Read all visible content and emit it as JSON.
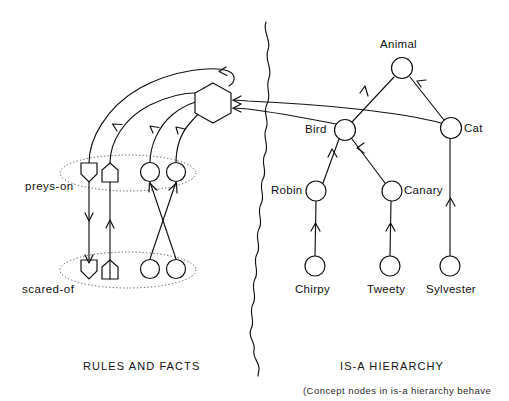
{
  "figure": {
    "background_color": "#ffffff",
    "ink_color": "#111111",
    "group_outline_color": "#4a4a4a"
  },
  "sections": {
    "left": {
      "label": "RULES AND FACTS"
    },
    "right": {
      "label": "IS-A HIERARCHY"
    }
  },
  "caption": {
    "text": "(Concept nodes in is-a hierarchy behave"
  },
  "relations": {
    "preys_on": {
      "label": "preys-on"
    },
    "scared_of": {
      "label": "scared-of"
    }
  },
  "hierarchy": {
    "nodes": [
      {
        "id": "animal",
        "label": "Animal",
        "x": 402,
        "y": 68,
        "r": 10.5,
        "label_pos": "above"
      },
      {
        "id": "bird",
        "label": "Bird",
        "x": 345,
        "y": 130,
        "r": 10.5,
        "label_pos": "left"
      },
      {
        "id": "cat",
        "label": "Cat",
        "x": 451,
        "y": 128,
        "r": 10.5,
        "label_pos": "right"
      },
      {
        "id": "robin",
        "label": "Robin",
        "x": 316,
        "y": 191,
        "r": 10.0,
        "label_pos": "left"
      },
      {
        "id": "canary",
        "label": "Canary",
        "x": 392,
        "y": 191,
        "r": 10.0,
        "label_pos": "right"
      },
      {
        "id": "chirpy",
        "label": "Chirpy",
        "x": 315,
        "y": 266,
        "r": 10.0,
        "label_pos": "below"
      },
      {
        "id": "tweety",
        "label": "Tweety",
        "x": 390,
        "y": 266,
        "r": 10.0,
        "label_pos": "below"
      },
      {
        "id": "sylvester",
        "label": "Sylvester",
        "x": 450,
        "y": 266,
        "r": 10.0,
        "label_pos": "below"
      }
    ],
    "isa_links": [
      {
        "from": "bird",
        "to": "animal"
      },
      {
        "from": "cat",
        "to": "animal"
      },
      {
        "from": "robin",
        "to": "bird"
      },
      {
        "from": "canary",
        "to": "bird"
      },
      {
        "from": "chirpy",
        "to": "robin"
      },
      {
        "from": "tweety",
        "to": "canary"
      },
      {
        "from": "sylvester",
        "to": "cat"
      }
    ]
  },
  "rules": {
    "frame_node": {
      "id": "rule-frame",
      "shape": "hexagon",
      "x": 213,
      "y": 103,
      "rx": 20,
      "ry": 20
    },
    "preys_on_group": {
      "ellipse": {
        "cx": 128,
        "cy": 173,
        "rx": 68,
        "ry": 18
      },
      "slots": [
        {
          "id": "preys-on-slot-1",
          "shape": "pentagon-down",
          "x": 89,
          "y": 172
        },
        {
          "id": "preys-on-slot-2",
          "shape": "pentagon-up",
          "x": 110,
          "y": 172
        },
        {
          "id": "preys-on-slot-3",
          "shape": "circle",
          "x": 150,
          "y": 172
        },
        {
          "id": "preys-on-slot-4",
          "shape": "circle",
          "x": 176,
          "y": 172
        }
      ]
    },
    "scared_of_group": {
      "ellipse": {
        "cx": 128,
        "cy": 270,
        "rx": 68,
        "ry": 18
      },
      "slots": [
        {
          "id": "scared-of-slot-1",
          "shape": "pentagon-down",
          "x": 89,
          "y": 269
        },
        {
          "id": "scared-of-slot-2",
          "shape": "pentagon-up",
          "x": 110,
          "y": 269
        },
        {
          "id": "scared-of-slot-3",
          "shape": "circle",
          "x": 150,
          "y": 269
        },
        {
          "id": "scared-of-slot-4",
          "shape": "circle",
          "x": 176,
          "y": 269
        }
      ]
    },
    "internal_links": [
      {
        "from": "preys-on-slot-1",
        "to": "scared-of-slot-1",
        "direction": "down"
      },
      {
        "from": "scared-of-slot-2",
        "to": "preys-on-slot-2",
        "direction": "up"
      },
      {
        "from": "scared-of-slot-3",
        "to": "preys-on-slot-4",
        "direction": "up"
      },
      {
        "from": "scared-of-slot-4",
        "to": "preys-on-slot-3",
        "direction": "up"
      }
    ],
    "frame_links": [
      {
        "from": "preys-on-slot-1",
        "to": "rule-frame",
        "arrow_at": "frame-top"
      },
      {
        "from": "preys-on-slot-2",
        "to": "rule-frame",
        "arrow_at": "mid"
      },
      {
        "from": "preys-on-slot-3",
        "to": "rule-frame",
        "arrow_at": "mid"
      },
      {
        "from": "preys-on-slot-4",
        "to": "rule-frame",
        "arrow_at": "mid"
      }
    ],
    "cross_links": [
      {
        "from": "cat",
        "to": "rule-frame",
        "arrow_at": "frame-right-upper"
      },
      {
        "from": "bird",
        "to": "rule-frame",
        "arrow_at": "frame-right-lower"
      }
    ]
  },
  "divider": {
    "name": "wavy-divider",
    "style": "hand-drawn wavy vertical line",
    "x": 266,
    "y_start": 22,
    "y_end": 376
  }
}
